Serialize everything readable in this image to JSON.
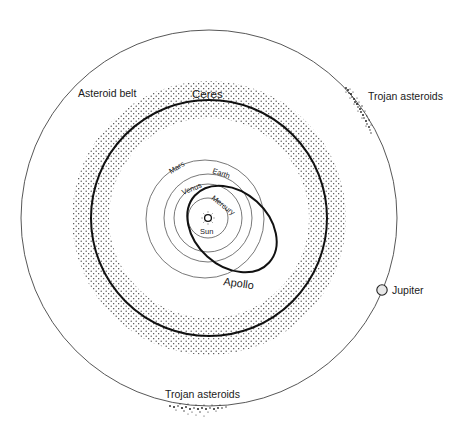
{
  "diagram": {
    "labels": {
      "asteroid_belt": "Asteroid belt",
      "ceres": "Ceres",
      "trojan_top": "Trojan asteroids",
      "trojan_bottom": "Trojan asteroids",
      "jupiter": "Jupiter",
      "mars": "Mars",
      "earth": "Earth",
      "venus": "Venus",
      "mercury": "Mercury",
      "sun": "Sun",
      "apollo": "Apollo"
    },
    "colors": {
      "line": "#222222",
      "thin_line": "#555555",
      "dots": "#333333",
      "background": "#ffffff"
    }
  }
}
